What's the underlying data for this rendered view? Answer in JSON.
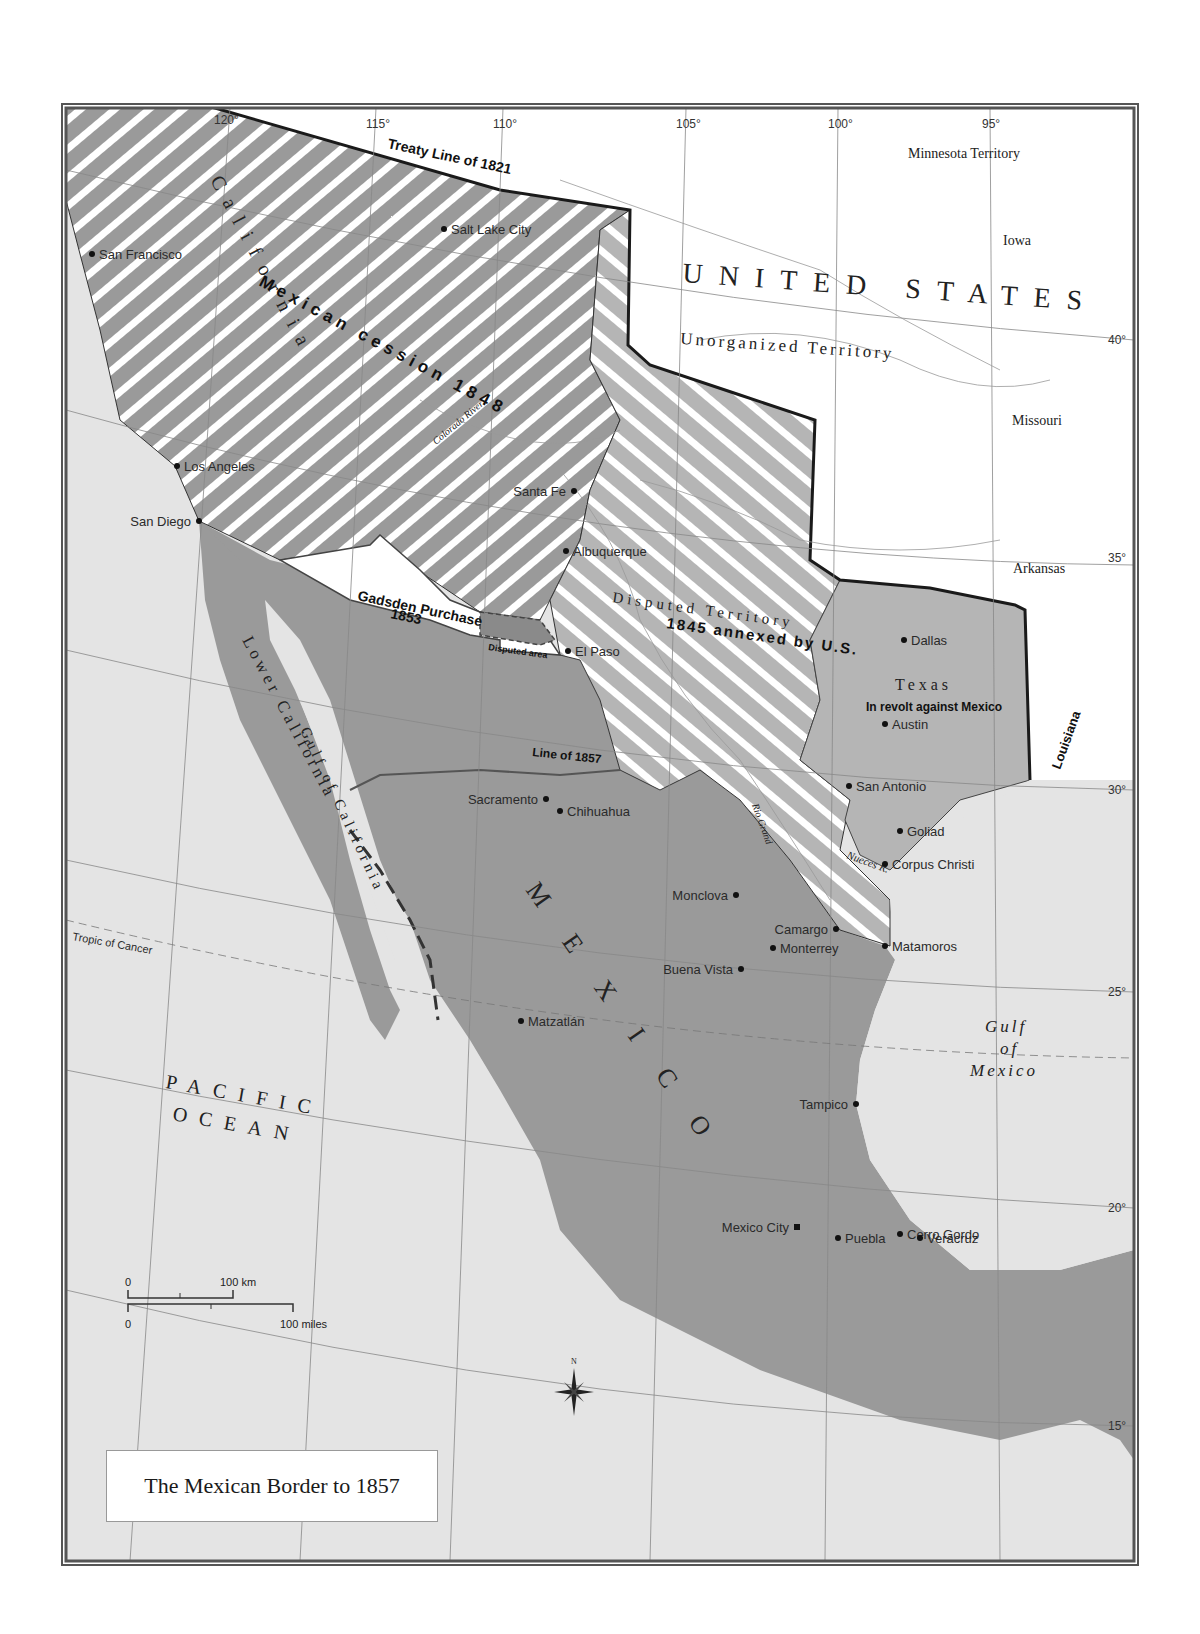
{
  "title": "The Mexican Border to 1857",
  "colors": {
    "frame": "#555555",
    "ocean": "#e4e4e4",
    "mexico": "#9a9a9a",
    "us": "#ffffff",
    "hatch_dark": "#9a9a9a",
    "hatch_light": "#ffffff",
    "texas": "#b5b5b5",
    "border_line": "#1a1a1a"
  },
  "longitudes": [
    "120°",
    "115°",
    "110°",
    "105°",
    "100°",
    "95°"
  ],
  "latitudes": [
    "40°",
    "35°",
    "30°",
    "25°",
    "20°",
    "15°"
  ],
  "regions": {
    "us": "UNITED STATES",
    "unorganized": "Unorganized Territory",
    "minnesota": "Minnesota Territory",
    "iowa": "Iowa",
    "missouri": "Missouri",
    "arkansas": "Arkansas",
    "louisiana": "Louisiana",
    "california": "California",
    "lower_california": "Lower California",
    "gulf_california": "Gulf of California",
    "mexico": "MEXICO",
    "texas": "Texas",
    "texas_note": "In revolt against Mexico",
    "disputed_territory": "Disputed Territory",
    "pacific_1": "PACIFIC",
    "pacific_2": "OCEAN",
    "gulf_mexico_1": "Gulf",
    "gulf_mexico_2": "of",
    "gulf_mexico_3": "Mexico"
  },
  "annotations": {
    "treaty_1821": "Treaty Line of 1821",
    "cession_1848": "Mexican cession 1848",
    "gadsden_1": "Gadsden Purchase",
    "gadsden_2": "1853",
    "disputed_area": "Disputed area",
    "annexed_1845": "1845 annexed by U.S.",
    "line_1857": "Line of 1857",
    "tropic": "Tropic of Cancer",
    "colorado_river": "Colorado River",
    "rio_grand": "Rio Grand",
    "nueces": "Nueces R."
  },
  "cities": [
    {
      "name": "San Francisco",
      "x": 92,
      "y": 254
    },
    {
      "name": "Salt Lake City",
      "x": 444,
      "y": 229
    },
    {
      "name": "Los Angeles",
      "x": 177,
      "y": 466
    },
    {
      "name": "San Diego",
      "x": 199,
      "y": 521
    },
    {
      "name": "Santa Fe",
      "x": 574,
      "y": 491
    },
    {
      "name": "Albuquerque",
      "x": 566,
      "y": 551
    },
    {
      "name": "El Paso",
      "x": 568,
      "y": 651
    },
    {
      "name": "Dallas",
      "x": 904,
      "y": 640
    },
    {
      "name": "Austin",
      "x": 885,
      "y": 724
    },
    {
      "name": "San Antonio",
      "x": 849,
      "y": 786
    },
    {
      "name": "Goliad",
      "x": 900,
      "y": 831
    },
    {
      "name": "Corpus Christi",
      "x": 885,
      "y": 864
    },
    {
      "name": "Sacramento",
      "x": 546,
      "y": 799
    },
    {
      "name": "Chihuahua",
      "x": 560,
      "y": 811
    },
    {
      "name": "Monclova",
      "x": 736,
      "y": 895
    },
    {
      "name": "Camargo",
      "x": 836,
      "y": 929
    },
    {
      "name": "Monterrey",
      "x": 773,
      "y": 948
    },
    {
      "name": "Buena Vista",
      "x": 741,
      "y": 969
    },
    {
      "name": "Matamoros",
      "x": 885,
      "y": 946
    },
    {
      "name": "Matzatlán",
      "x": 521,
      "y": 1021
    },
    {
      "name": "Tampico",
      "x": 856,
      "y": 1104
    },
    {
      "name": "Mexico City",
      "x": 797,
      "y": 1227
    },
    {
      "name": "Puebla",
      "x": 838,
      "y": 1238
    },
    {
      "name": "Cerro Gordo",
      "x": 900,
      "y": 1234
    },
    {
      "name": "Veracruz",
      "x": 920,
      "y": 1238
    }
  ],
  "scale": {
    "km_zero": "0",
    "km_label": "100 km",
    "mi_zero": "0",
    "mi_label": "100 miles"
  },
  "compass": {
    "north": "N"
  }
}
